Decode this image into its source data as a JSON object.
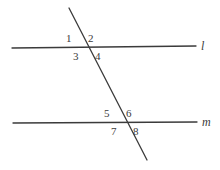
{
  "figure": {
    "kind": "geometry-diagram",
    "background_color": "#ffffff",
    "stroke_color": "#3b3b3b",
    "text_color": "#3b3b3b",
    "stroke_width": 1.3
  },
  "lines": [
    {
      "id": "line-l",
      "name": "l",
      "x1": 12,
      "y1": 48,
      "x2": 196,
      "y2": 46,
      "label_x": 201,
      "label_y": 40
    },
    {
      "id": "line-m",
      "name": "m",
      "x1": 13,
      "y1": 123,
      "x2": 197,
      "y2": 122,
      "label_x": 202,
      "label_y": 116
    },
    {
      "id": "transversal",
      "name": "",
      "x1": 69,
      "y1": 8,
      "x2": 147,
      "y2": 160,
      "label_x": 0,
      "label_y": 0
    }
  ],
  "intersections": [
    {
      "id": "intersection-top",
      "x": 86,
      "y": 47
    },
    {
      "id": "intersection-bottom",
      "x": 124,
      "y": 123
    }
  ],
  "angles": [
    {
      "id": "angle-1",
      "label": "1",
      "x": 66,
      "y": 33,
      "position": "upper-left-of-top-intersection"
    },
    {
      "id": "angle-2",
      "label": "2",
      "x": 88,
      "y": 33,
      "position": "upper-right-of-top-intersection"
    },
    {
      "id": "angle-3",
      "label": "3",
      "x": 73,
      "y": 51,
      "position": "lower-left-of-top-intersection"
    },
    {
      "id": "angle-4",
      "label": "4",
      "x": 95,
      "y": 51,
      "position": "lower-right-of-top-intersection"
    },
    {
      "id": "angle-5",
      "label": "5",
      "x": 104,
      "y": 108,
      "position": "upper-left-of-bottom-intersection"
    },
    {
      "id": "angle-6",
      "label": "6",
      "x": 126,
      "y": 108,
      "position": "upper-right-of-bottom-intersection"
    },
    {
      "id": "angle-7",
      "label": "7",
      "x": 111,
      "y": 126,
      "position": "lower-left-of-bottom-intersection"
    },
    {
      "id": "angle-8",
      "label": "8",
      "x": 133,
      "y": 126,
      "position": "lower-right-of-bottom-intersection"
    }
  ]
}
